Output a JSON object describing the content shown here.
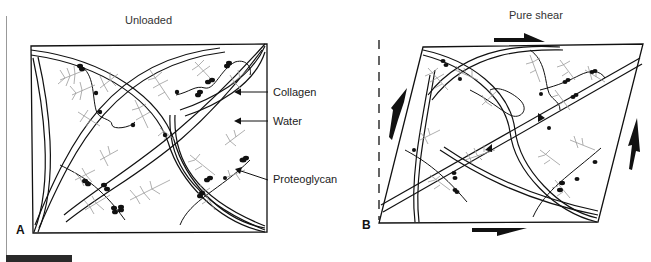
{
  "figure": {
    "panel_a": {
      "title": "Unloaded",
      "letter": "A",
      "labels": {
        "collagen": "Collagen",
        "water": "Water",
        "proteoglycan": "Proteoglycan"
      }
    },
    "panel_b": {
      "title": "Pure shear",
      "letter": "B"
    },
    "colors": {
      "line": "#111111",
      "proteoglycan_branches": "#9a9a9a",
      "caption_bar": "#2a2a2a"
    }
  }
}
